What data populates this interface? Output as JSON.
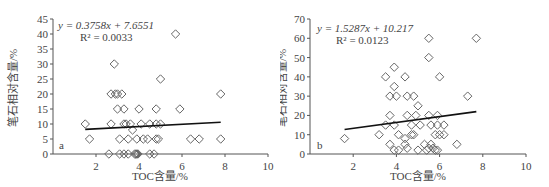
{
  "chart_data": [
    {
      "type": "scatter",
      "panel_label": "a",
      "title": "",
      "xlabel": "TOC含量/%",
      "ylabel": "笔石相对含量/%",
      "xlim": [
        0,
        10
      ],
      "ylim": [
        0,
        45
      ],
      "xticks": [
        2,
        4,
        6,
        8,
        10
      ],
      "yticks": [
        0,
        5,
        10,
        15,
        20,
        25,
        30,
        35,
        40,
        45
      ],
      "grid": false,
      "legend": "none",
      "equation": "y = 0.3758x + 7.6551",
      "r2": "R² = 0.0033",
      "trendline": {
        "slope": 0.3758,
        "intercept": 7.6551,
        "x_range": [
          1.5,
          7.8
        ]
      },
      "marker": "diamond-open",
      "points": [
        [
          1.5,
          10
        ],
        [
          1.7,
          5
        ],
        [
          2.6,
          0
        ],
        [
          2.7,
          20
        ],
        [
          2.7,
          10
        ],
        [
          2.85,
          30
        ],
        [
          2.9,
          20
        ],
        [
          3.0,
          20
        ],
        [
          3.0,
          15
        ],
        [
          3.2,
          20
        ],
        [
          3.1,
          5
        ],
        [
          3.1,
          0
        ],
        [
          3.3,
          15
        ],
        [
          3.3,
          10
        ],
        [
          3.3,
          0
        ],
        [
          3.4,
          10
        ],
        [
          3.5,
          0
        ],
        [
          3.5,
          5
        ],
        [
          3.6,
          10
        ],
        [
          3.7,
          8
        ],
        [
          3.8,
          0
        ],
        [
          3.85,
          0
        ],
        [
          3.9,
          0
        ],
        [
          3.9,
          5
        ],
        [
          3.95,
          0
        ],
        [
          4.0,
          15
        ],
        [
          4.1,
          10
        ],
        [
          4.2,
          5
        ],
        [
          4.4,
          5
        ],
        [
          4.5,
          10
        ],
        [
          4.5,
          0
        ],
        [
          4.7,
          0
        ],
        [
          4.8,
          15
        ],
        [
          4.8,
          10
        ],
        [
          4.8,
          5
        ],
        [
          4.9,
          5
        ],
        [
          5.0,
          10
        ],
        [
          5.0,
          25
        ],
        [
          5.7,
          40
        ],
        [
          5.9,
          15
        ],
        [
          6.4,
          5
        ],
        [
          6.8,
          5
        ],
        [
          7.8,
          20
        ],
        [
          7.8,
          5
        ]
      ]
    },
    {
      "type": "scatter",
      "panel_label": "b",
      "title": "",
      "xlabel": "TOC含量/%",
      "ylabel": "笔石相对含量/%",
      "xlim": [
        0,
        10
      ],
      "ylim": [
        0,
        70
      ],
      "xticks": [
        2,
        4,
        6,
        8,
        10
      ],
      "yticks": [
        0,
        10,
        20,
        30,
        40,
        50,
        60,
        70
      ],
      "grid": false,
      "legend": "none",
      "equation": "y = 1.5287x + 10.217",
      "r2": "R² = 0.0123",
      "trendline": {
        "slope": 1.5287,
        "intercept": 10.217,
        "x_range": [
          1.6,
          7.7
        ]
      },
      "marker": "diamond-open",
      "points": [
        [
          1.6,
          8
        ],
        [
          3.2,
          10
        ],
        [
          3.5,
          40
        ],
        [
          3.5,
          15
        ],
        [
          3.7,
          30
        ],
        [
          3.7,
          20
        ],
        [
          3.7,
          5
        ],
        [
          3.9,
          45
        ],
        [
          3.9,
          35
        ],
        [
          3.9,
          15
        ],
        [
          3.9,
          2
        ],
        [
          4.0,
          30
        ],
        [
          4.1,
          10
        ],
        [
          4.1,
          2
        ],
        [
          4.4,
          40
        ],
        [
          4.4,
          8
        ],
        [
          4.4,
          5
        ],
        [
          4.5,
          30
        ],
        [
          4.5,
          20
        ],
        [
          4.5,
          3
        ],
        [
          4.7,
          15
        ],
        [
          4.7,
          10
        ],
        [
          4.8,
          30
        ],
        [
          4.8,
          10
        ],
        [
          4.9,
          20
        ],
        [
          5.0,
          25
        ],
        [
          5.0,
          2
        ],
        [
          5.1,
          15
        ],
        [
          5.3,
          5
        ],
        [
          5.4,
          2
        ],
        [
          5.5,
          60
        ],
        [
          5.5,
          50
        ],
        [
          5.5,
          20
        ],
        [
          5.5,
          3
        ],
        [
          5.6,
          15
        ],
        [
          5.6,
          5
        ],
        [
          5.7,
          3
        ],
        [
          5.8,
          10
        ],
        [
          5.8,
          2
        ],
        [
          5.9,
          20
        ],
        [
          5.9,
          15
        ],
        [
          5.9,
          2
        ],
        [
          6.0,
          40
        ],
        [
          6.0,
          10
        ],
        [
          6.2,
          15
        ],
        [
          6.2,
          10
        ],
        [
          6.8,
          5
        ],
        [
          7.3,
          30
        ],
        [
          7.7,
          60
        ]
      ]
    }
  ],
  "style": {
    "axis_color": "#555555",
    "marker_color": "#666666",
    "trendline_color": "#111111"
  }
}
